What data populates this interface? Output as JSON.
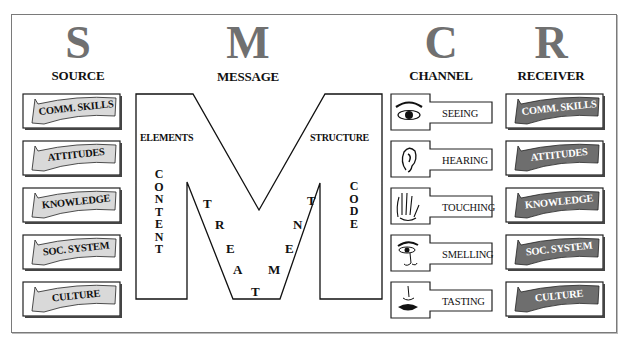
{
  "columns": [
    {
      "letter": "S",
      "title": "SOURCE"
    },
    {
      "letter": "M",
      "title": "MESSAGE"
    },
    {
      "letter": "C",
      "title": "CHANNEL"
    },
    {
      "letter": "R",
      "title": "RECEIVER"
    }
  ],
  "source": {
    "items": [
      "COMM. SKILLS",
      "ATTITUDES",
      "KNOWLEDGE",
      "SOC. SYSTEM",
      "CULTURE"
    ],
    "banner_color": "#d9d9d9"
  },
  "message": {
    "elements_label": "ELEMENTS",
    "structure_label": "STRUCTURE",
    "content_vertical": [
      "C",
      "O",
      "N",
      "T",
      "E",
      "N",
      "T"
    ],
    "code_vertical": [
      "C",
      "O",
      "D",
      "E"
    ],
    "treatment_letters": [
      "T",
      "R",
      "E",
      "A",
      "T",
      "M",
      "E",
      "N",
      "T"
    ]
  },
  "channel": {
    "items": [
      {
        "label": "SEEING",
        "icon": "eye-icon"
      },
      {
        "label": "HEARING",
        "icon": "ear-icon"
      },
      {
        "label": "TOUCHING",
        "icon": "hand-icon"
      },
      {
        "label": "SMELLING",
        "icon": "nose-icon"
      },
      {
        "label": "TASTING",
        "icon": "mouth-icon"
      }
    ]
  },
  "receiver": {
    "items": [
      "COMM. SKILLS",
      "ATTITUDES",
      "KNOWLEDGE",
      "SOC. SYSTEM",
      "CULTURE"
    ],
    "banner_color": "#6e6e6e"
  }
}
